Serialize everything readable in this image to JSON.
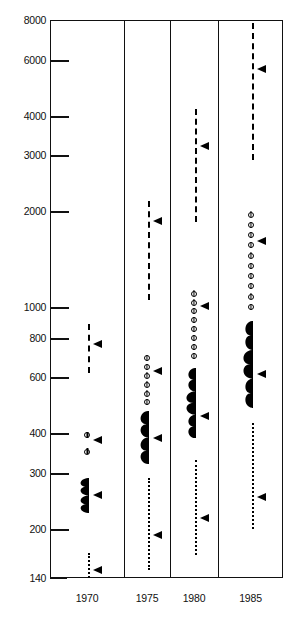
{
  "chart_data": {
    "type": "scatter",
    "title": "",
    "subtitle": "",
    "xlabel": "",
    "ylabel": "",
    "yscale": "log",
    "ylim": [
      140,
      8000
    ],
    "grid": false,
    "legend": null,
    "ytick_labels": [
      "8000",
      "6000",
      "4000",
      "3000",
      "2000",
      "1000",
      "800",
      "600",
      "400",
      "300",
      "200",
      "140"
    ],
    "ytick_values": [
      8000,
      6000,
      4000,
      3000,
      2000,
      1000,
      800,
      600,
      400,
      300,
      200,
      140
    ],
    "categories": [
      "1970",
      "1975",
      "1980",
      "1985"
    ],
    "panels": [
      {
        "label": "1970",
        "series": [
          {
            "name": "dashed-series",
            "style": "dashed",
            "low": 620,
            "high": 880,
            "marker": 760
          },
          {
            "name": "circles-series",
            "style": "circles",
            "low": 350,
            "high": 395,
            "marker": 380,
            "n": 2
          },
          {
            "name": "violin-series",
            "style": "violin",
            "low": 225,
            "high": 290,
            "marker": 255
          },
          {
            "name": "dotted-series",
            "style": "dotted",
            "low": 140,
            "high": 168,
            "marker": 148
          }
        ]
      },
      {
        "label": "1975",
        "series": [
          {
            "name": "dashed-series",
            "style": "dashed",
            "low": 1050,
            "high": 2150,
            "marker": 1850
          },
          {
            "name": "circles-series",
            "style": "circles",
            "low": 500,
            "high": 690,
            "marker": 625,
            "n": 6
          },
          {
            "name": "violin-series",
            "style": "violin",
            "low": 320,
            "high": 470,
            "marker": 385
          },
          {
            "name": "dotted-series",
            "style": "dotted",
            "low": 148,
            "high": 290,
            "marker": 190
          }
        ]
      },
      {
        "label": "1980",
        "series": [
          {
            "name": "dashed-series",
            "style": "dashed",
            "low": 1850,
            "high": 4200,
            "marker": 3200
          },
          {
            "name": "circles-series",
            "style": "circles",
            "low": 700,
            "high": 1100,
            "marker": 1000,
            "n": 8
          },
          {
            "name": "violin-series",
            "style": "violin",
            "low": 385,
            "high": 640,
            "marker": 450
          },
          {
            "name": "dotted-series",
            "style": "dotted",
            "low": 165,
            "high": 330,
            "marker": 215
          }
        ]
      },
      {
        "label": "1985",
        "series": [
          {
            "name": "dashed-series",
            "style": "dashed",
            "low": 2900,
            "high": 7800,
            "marker": 5600
          },
          {
            "name": "circles-series",
            "style": "circles",
            "low": 1000,
            "high": 1950,
            "marker": 1600,
            "n": 10
          },
          {
            "name": "violin-series",
            "style": "violin",
            "low": 480,
            "high": 900,
            "marker": 610
          },
          {
            "name": "dotted-series",
            "style": "dotted",
            "low": 200,
            "high": 430,
            "marker": 250
          }
        ]
      }
    ]
  }
}
